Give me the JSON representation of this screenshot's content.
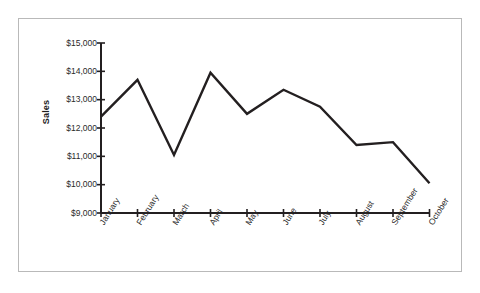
{
  "chart_data": {
    "type": "line",
    "title": "",
    "subtitle": "",
    "xlabel": "",
    "ylabel": "Sales",
    "categories": [
      "January",
      "February",
      "March",
      "April",
      "May",
      "June",
      "July",
      "August",
      "September",
      "October"
    ],
    "values": [
      12400,
      13700,
      11050,
      13950,
      12500,
      13350,
      12750,
      11400,
      11500,
      10050
    ],
    "series": [
      {
        "name": "Sales",
        "values": [
          12400,
          13700,
          11050,
          13950,
          12500,
          13350,
          12750,
          11400,
          11500,
          10050
        ]
      }
    ],
    "ylim": [
      9000,
      15000
    ],
    "ytick_values": [
      9000,
      10000,
      11000,
      12000,
      13000,
      14000,
      15000
    ],
    "ytick_labels": [
      "$9,000",
      "$10,000",
      "$11,000",
      "$12,000",
      "$13,000",
      "$14,000",
      "$15,000"
    ],
    "xtick_labels": [
      "January",
      "February",
      "March",
      "April",
      "May",
      "June",
      "July",
      "August",
      "September",
      "October"
    ],
    "grid": false,
    "legend": false,
    "legend_position": "none",
    "line_color": "#231f20",
    "axis_color": "#231f20",
    "frame_color": "#b9b9b9",
    "background_color": "#ffffff",
    "text_color": "#2a2a2a",
    "xtick_label_rotation": -58,
    "annotations": []
  }
}
